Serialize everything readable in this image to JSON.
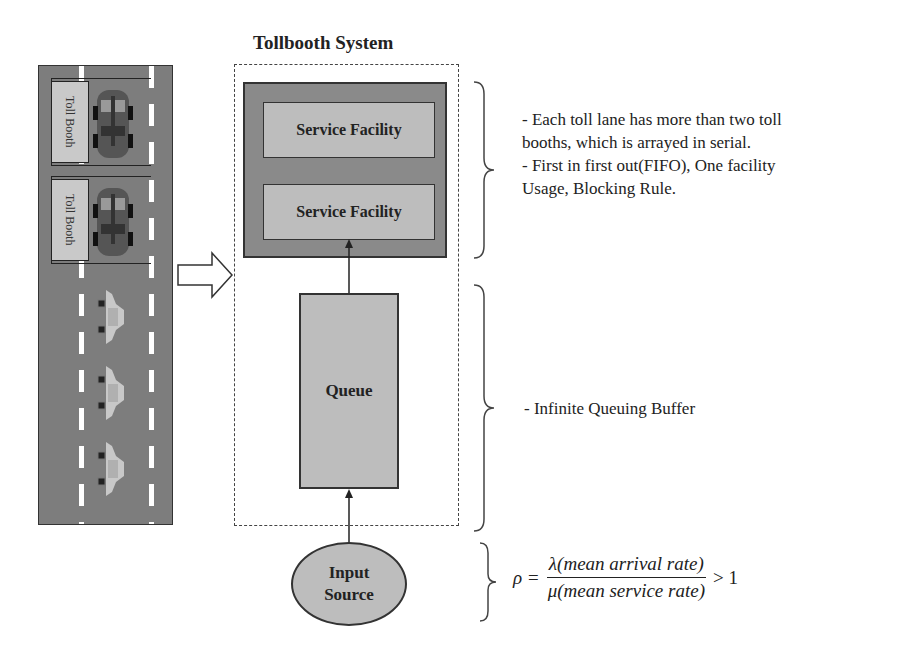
{
  "title": "Tollbooth System",
  "road": {
    "booths": [
      {
        "label": "Toll Booth"
      },
      {
        "label": "Toll Booth"
      }
    ],
    "waiting_cars": 3
  },
  "system": {
    "service_facilities": [
      {
        "label": "Service Facility"
      },
      {
        "label": "Service Facility"
      }
    ],
    "queue_label": "Queue",
    "input_source": {
      "line1": "Input",
      "line2": "Source"
    }
  },
  "annotations": {
    "service": [
      "- Each toll lane has more than two toll",
      "booths, which is arrayed in serial.",
      "- First in first out(FIFO), One facility",
      "Usage, Blocking Rule."
    ],
    "queue": "- Infinite Queuing Buffer",
    "formula": {
      "lhs": "ρ =",
      "numerator": "λ(mean arrival rate)",
      "denominator": "μ(mean service rate)",
      "rhs": "> 1"
    }
  },
  "colors": {
    "road": "#7d7d7d",
    "box_dark": "#8a8a8a",
    "box_light": "#bdbdbd",
    "line": "#333333"
  }
}
